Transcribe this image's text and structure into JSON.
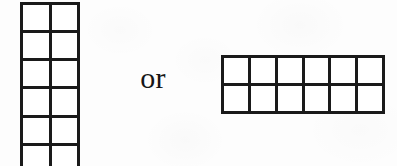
{
  "figure": {
    "kind": "rectangular-array-diagram",
    "background_color": "#fdfdfd",
    "line_color": "#1a1a1a",
    "cell_color": "#ffffff",
    "text_color": "#161616",
    "conjunction_label": "or",
    "arrays": [
      {
        "name": "vertical-array",
        "columns": 2,
        "rows": 6,
        "total_cells": 12,
        "orientation": "vertical",
        "clipped_at_bottom": true
      },
      {
        "name": "horizontal-array",
        "columns": 6,
        "rows": 2,
        "total_cells": 12,
        "orientation": "horizontal",
        "clipped_at_bottom": false
      }
    ]
  }
}
